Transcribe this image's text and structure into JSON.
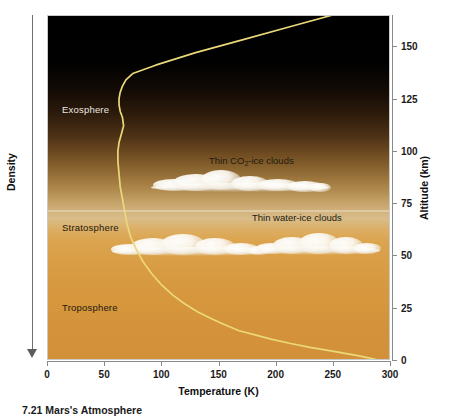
{
  "figure": {
    "caption": "7.21 Mars's Atmosphere"
  },
  "axes": {
    "x_title": "Temperature (K)",
    "y_title": "Altitude (km)",
    "left_title": "Density",
    "x_ticks": [
      "0",
      "50",
      "100",
      "150",
      "200",
      "250",
      "300"
    ],
    "y_ticks": [
      "0",
      "25",
      "50",
      "75",
      "100",
      "125",
      "150"
    ]
  },
  "layers": [
    {
      "name": "exosphere-label",
      "label": "Exosphere",
      "tone": "light"
    },
    {
      "name": "stratosphere-label",
      "label": "Stratosphere",
      "tone": "dark"
    },
    {
      "name": "troposphere-label",
      "label": "Troposphere",
      "tone": "dark"
    }
  ],
  "annotations": {
    "co2_clouds_prefix": "Thin CO",
    "co2_clouds_sub": "2",
    "co2_clouds_suffix": "-ice clouds",
    "water_clouds": "Thin water-ice clouds"
  },
  "colors": {
    "curve": "#ead87a",
    "sky_top": "#000000",
    "sky_bottom": "#d29038",
    "label_light": "#e9e6e0",
    "label_dark": "#231a10"
  },
  "chart_data": {
    "type": "line",
    "title": "Mars's Atmosphere",
    "xlabel": "Temperature (K)",
    "ylabel": "Altitude (km)",
    "xlim": [
      0,
      300
    ],
    "ylim": [
      0,
      165
    ],
    "grid": false,
    "legend": "none",
    "series": [
      {
        "name": "Temperature profile",
        "color": "#ead87a",
        "x": [
          290,
          273,
          252,
          230,
          212,
          196,
          182,
          168,
          155,
          143,
          132,
          120,
          110,
          100,
          92,
          84,
          78,
          73,
          70,
          68,
          66,
          64,
          63,
          62,
          62,
          63,
          65,
          67,
          66,
          64,
          63,
          63,
          64,
          66,
          69,
          75,
          95,
          130,
          170,
          210,
          250
        ],
        "y": [
          0,
          2,
          4,
          6,
          8,
          10,
          12,
          14,
          17,
          20,
          23,
          27,
          31,
          36,
          41,
          47,
          53,
          59,
          65,
          71,
          77,
          83,
          89,
          95,
          100,
          104,
          108,
          112,
          116,
          119,
          122,
          125,
          128,
          131,
          134,
          137,
          141,
          147,
          153,
          159,
          165
        ]
      }
    ],
    "regions": [
      {
        "label": "Troposphere",
        "altitude_range_km": [
          0,
          40
        ]
      },
      {
        "label": "Stratosphere",
        "altitude_range_km": [
          40,
          110
        ]
      },
      {
        "label": "Exosphere",
        "altitude_range_km": [
          110,
          165
        ]
      }
    ],
    "cloud_bands": [
      {
        "label": "Thin CO2-ice clouds",
        "altitude_km": 40,
        "temperature_range_K": [
          110,
          200
        ]
      },
      {
        "label": "Thin water-ice clouds",
        "altitude_km": 13,
        "temperature_range_K": [
          75,
          250
        ]
      }
    ],
    "annotations": [
      {
        "text": "Density",
        "position": "left-axis",
        "direction": "increasing-downward"
      }
    ]
  }
}
